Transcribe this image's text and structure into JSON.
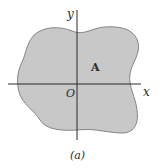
{
  "figure": {
    "caption": "(a)",
    "labels": {
      "y_axis": "y",
      "x_axis": "x",
      "origin": "O",
      "area": "A"
    },
    "colors": {
      "region_fill": "#c8c8c8",
      "region_stroke": "#6e6e6e",
      "axis": "#2a2a2a",
      "background": "#ffffff"
    }
  }
}
